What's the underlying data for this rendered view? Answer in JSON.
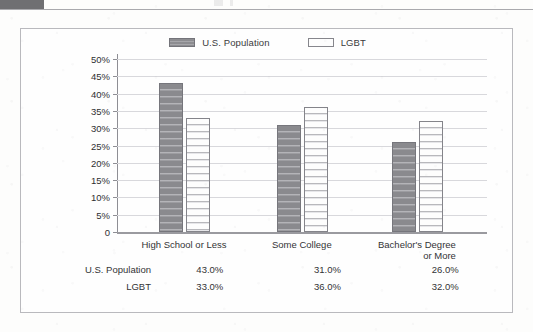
{
  "header": {
    "block_present": true
  },
  "legend": {
    "entries": [
      {
        "label": "U.S. Population",
        "swatch": "dark-striped-swatch",
        "color": "#8a8a8e"
      },
      {
        "label": "LGBT",
        "swatch": "white-outlined-swatch",
        "color": "#fdfdfd"
      }
    ]
  },
  "chart_data": {
    "type": "bar",
    "title": "",
    "xlabel": "",
    "ylabel": "",
    "categories": [
      "High School or Less",
      "Some College",
      "Bachelor's Degree or More"
    ],
    "category_lines": [
      [
        "High School or Less"
      ],
      [
        "Some College"
      ],
      [
        "Bachelor's Degree",
        "or More"
      ]
    ],
    "series": [
      {
        "name": "U.S. Population",
        "values": [
          43.0,
          31.0,
          26.0
        ],
        "color": "#8a8a8e"
      },
      {
        "name": "LGBT",
        "values": [
          33.0,
          36.0,
          32.0
        ],
        "color": "#fdfdfd"
      }
    ],
    "ylim": [
      0,
      50
    ],
    "ytick_values": [
      50,
      45,
      40,
      35,
      30,
      25,
      20,
      15,
      10,
      5,
      0
    ],
    "ytick_labels": [
      "50%",
      "45%",
      "40%",
      "35%",
      "30%",
      "25%",
      "20%",
      "15%",
      "10%",
      "5%",
      "0"
    ],
    "grid": true,
    "legend_position": "top-center"
  },
  "table": {
    "rows": [
      {
        "label": "U.S. Population",
        "values": [
          "43.0%",
          "31.0%",
          "26.0%"
        ]
      },
      {
        "label": "LGBT",
        "values": [
          "33.0%",
          "36.0%",
          "32.0%"
        ]
      }
    ]
  },
  "colors": {
    "panel_border": "#b9b9bd",
    "gridline": "#d8d8dc",
    "axis": "#8e8e94",
    "text": "#333335",
    "page_background": "#fdfdfc"
  }
}
